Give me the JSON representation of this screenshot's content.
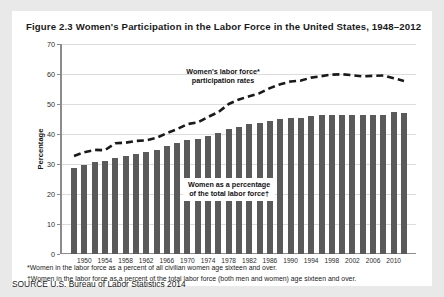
{
  "figure": {
    "title": "Figure 2.3  Women's Participation in the Labor Force in the United States, 1948–2012",
    "source": "SOURCE  U.S. Bureau of Labor Statistics 2014",
    "footnote_star": "*Women in the labor force as a percent of all civilian women age sixteen and over.",
    "footnote_dagger": "†Women in the labor force as a percent of the total labor force (both men and women) age sixteen and over.",
    "annotation_line": "Women's labor force* participation rates",
    "annotation_line_1": "Women's labor force*",
    "annotation_line_2": "participation rates",
    "annotation_bars_1": "Women as a percentage",
    "annotation_bars_2": "of the total labor force†",
    "bar_color": "#5a5a5a",
    "line_color": "#1a1a1a",
    "grid_color": "#dcdcdc",
    "axis_color": "#8c8c8c",
    "panel_color": "#ffffff",
    "page_color": "#e9e9e9"
  },
  "chart_data": {
    "type": "bar",
    "title": "Figure 2.3  Women's Participation in the Labor Force in the United States, 1948–2012",
    "xlabel": "",
    "ylabel": "Percentage",
    "ylim": [
      0,
      70
    ],
    "yticks": [
      0,
      10,
      20,
      30,
      40,
      50,
      60,
      70
    ],
    "xticks": [
      1950,
      1954,
      1958,
      1962,
      1966,
      1970,
      1974,
      1978,
      1982,
      1986,
      1990,
      1994,
      1998,
      2002,
      2006,
      2010
    ],
    "grid": true,
    "legend": "none",
    "x": [
      1948,
      1950,
      1952,
      1954,
      1956,
      1958,
      1960,
      1962,
      1964,
      1966,
      1968,
      1970,
      1972,
      1974,
      1976,
      1978,
      1980,
      1982,
      1984,
      1986,
      1988,
      1990,
      1992,
      1994,
      1996,
      1998,
      2000,
      2002,
      2004,
      2006,
      2008,
      2010,
      2012
    ],
    "series": [
      {
        "name": "Women as a percentage of the total labor force†",
        "type": "bar",
        "values": [
          28.6,
          29.6,
          30.8,
          30.9,
          31.9,
          32.7,
          33.4,
          34.0,
          34.8,
          36.0,
          37.1,
          38.1,
          38.5,
          39.4,
          40.5,
          41.7,
          42.5,
          43.3,
          43.8,
          44.5,
          45.0,
          45.3,
          45.5,
          46.0,
          46.2,
          46.3,
          46.5,
          46.5,
          46.4,
          46.3,
          46.5,
          47.2,
          46.9
        ]
      },
      {
        "name": "Women's labor force* participation rates",
        "type": "line",
        "style": "dashed",
        "values": [
          32.7,
          33.9,
          34.7,
          34.6,
          36.9,
          37.1,
          37.7,
          37.9,
          38.7,
          40.3,
          41.6,
          43.3,
          43.9,
          45.7,
          47.3,
          50.0,
          51.5,
          52.6,
          53.6,
          55.3,
          56.6,
          57.5,
          57.8,
          58.8,
          59.3,
          59.8,
          59.9,
          59.6,
          59.2,
          59.4,
          59.5,
          58.6,
          57.7
        ]
      }
    ]
  }
}
